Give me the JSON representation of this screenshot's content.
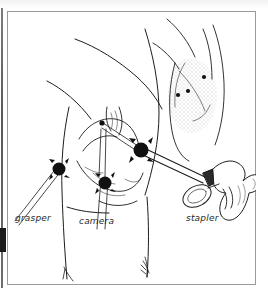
{
  "figure": {
    "kind": "medical-line-drawing",
    "background_color": "#ffffff",
    "ink_color": "#1a1a1a",
    "frame_color": "#9a9a9a"
  },
  "frame": {
    "name": "plate-border",
    "x": 7,
    "y": 11,
    "width": 249,
    "height": 274
  },
  "labels": [
    {
      "id": "grasper",
      "text": "grasper",
      "x": 15,
      "y": 213
    },
    {
      "id": "camera",
      "text": "camera",
      "x": 79,
      "y": 216
    },
    {
      "id": "stapler",
      "text": "stapler",
      "x": 186,
      "y": 213
    }
  ],
  "main_drawing": {
    "name": "patient-torso-lateral-view",
    "description": "Lateral decubitus torso with arm raised; three trocar ports on the chest wall",
    "ports": [
      {
        "id": "port-grasper",
        "label_ref": "grasper",
        "cx": 52,
        "cy": 158,
        "r": 7
      },
      {
        "id": "port-camera",
        "label_ref": "camera",
        "cx": 98,
        "cy": 172,
        "r": 7
      },
      {
        "id": "port-stapler",
        "label_ref": "stapler",
        "cx": 134,
        "cy": 139,
        "r": 8
      }
    ],
    "instruments": [
      {
        "id": "grasper-shaft",
        "from": [
          52,
          158
        ],
        "to": [
          10,
          212
        ],
        "style": "thin-double-line"
      },
      {
        "id": "camera-shaft",
        "from": [
          98,
          172
        ],
        "to": [
          96,
          218
        ],
        "style": "thin-double-line"
      },
      {
        "id": "stapler-shaft",
        "from": [
          134,
          139
        ],
        "to": [
          200,
          172
        ],
        "style": "thick-double-line"
      }
    ]
  },
  "inset_drawing": {
    "name": "port-site-inset",
    "description": "Small inset of the lateral chest wall with stippled shading showing the port entry sites",
    "x": 150,
    "y": 18,
    "width": 100,
    "height": 115,
    "port_dots": [
      {
        "id": "inset-dot-1",
        "cx": 204,
        "cy": 75,
        "r": 2
      },
      {
        "id": "inset-dot-2",
        "cx": 188,
        "cy": 88,
        "r": 2
      },
      {
        "id": "inset-dot-3",
        "cx": 178,
        "cy": 92,
        "r": 2
      }
    ],
    "shading": "stipple-dots"
  },
  "stapler_instrument": {
    "name": "endoscopic-linear-stapler",
    "parts": [
      "shaft",
      "collar",
      "pistol-grip-handle",
      "thumb-ring",
      "trigger"
    ],
    "x": 178,
    "y": 145,
    "width": 72,
    "height": 65
  }
}
